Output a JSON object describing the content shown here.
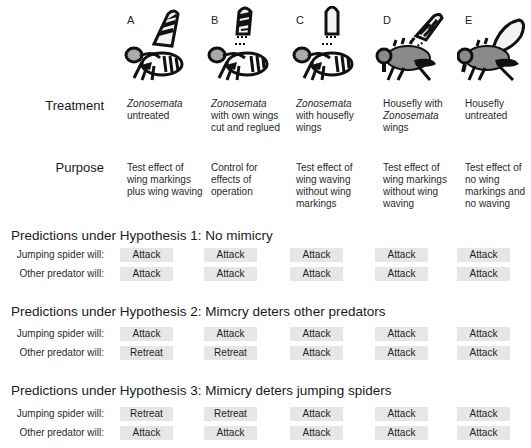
{
  "columns": [
    {
      "letter": "A",
      "treatment_italic": "Zonosemata",
      "treatment_rest": "untreated",
      "treatment_prefix": "",
      "purpose": "Test effect of wing markings plus wing waving",
      "insect": "zonosemata-fly-striped-wing"
    },
    {
      "letter": "B",
      "treatment_italic": "Zonosemata",
      "treatment_rest": "with own wings cut and reglued",
      "treatment_prefix": "",
      "purpose": "Control for effects of operation",
      "insect": "zonosemata-fly-cut-reglued-striped-wing"
    },
    {
      "letter": "C",
      "treatment_italic": "Zonosemata",
      "treatment_rest": "with housefly wings",
      "treatment_prefix": "",
      "purpose": "Test effect of wing waving without wing markings",
      "insect": "zonosemata-fly-clear-wing"
    },
    {
      "letter": "D",
      "treatment_prefix": "Housefly with",
      "treatment_italic": "Zonosemata",
      "treatment_rest": "wings",
      "purpose": "Test effect of wing markings without wing waving",
      "insect": "housefly-striped-wing"
    },
    {
      "letter": "E",
      "treatment_prefix": "Housefly untreated",
      "treatment_italic": "",
      "treatment_rest": "",
      "purpose": "Test effect of no wing markings and no waving",
      "insect": "housefly-clear-wing"
    }
  ],
  "labels": {
    "treatment": "Treatment",
    "purpose": "Purpose",
    "jumping_spider": "Jumping spider will:",
    "other_predator": "Other predator will:"
  },
  "hypotheses": [
    {
      "title": "Predictions under Hypothesis 1: No mimicry",
      "jumping_spider": [
        "Attack",
        "Attack",
        "Attack",
        "Attack",
        "Attack"
      ],
      "other_predator": [
        "Attack",
        "Attack",
        "Attack",
        "Attack",
        "Attack"
      ]
    },
    {
      "title": "Predictions under Hypothesis 2: Mimcry deters other predators",
      "jumping_spider": [
        "Attack",
        "Attack",
        "Attack",
        "Attack",
        "Attack"
      ],
      "other_predator": [
        "Retreat",
        "Retreat",
        "Attack",
        "Attack",
        "Attack"
      ]
    },
    {
      "title": "Predictions under Hypothesis 3: Mimicry deters jumping spiders",
      "jumping_spider": [
        "Retreat",
        "Retreat",
        "Attack",
        "Attack",
        "Attack"
      ],
      "other_predator": [
        "Attack",
        "Attack",
        "Attack",
        "Attack",
        "Attack"
      ]
    }
  ],
  "colors": {
    "badge_bg": "#e6e6e6",
    "housefly_body": "#8a8a8a",
    "wing_clear": "#f2f2f2",
    "ink": "#111111"
  }
}
